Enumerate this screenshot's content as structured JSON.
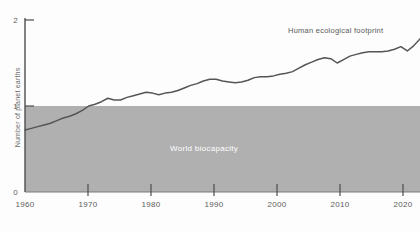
{
  "chart_data": {
    "type": "line",
    "title": "",
    "xlabel": "",
    "ylabel": "Number of planet earths",
    "xlim": [
      1960,
      2022
    ],
    "ylim": [
      0,
      2
    ],
    "grid": false,
    "legend_position": "inline-annotation",
    "x_ticks": [
      "1960",
      "1970",
      "1980",
      "1990",
      "2000",
      "2010",
      "2020"
    ],
    "x_tick_values": [
      1960,
      1970,
      1980,
      1990,
      2000,
      2010,
      2020
    ],
    "y_ticks": [
      "0",
      "1",
      "2"
    ],
    "y_tick_values": [
      0,
      1,
      2
    ],
    "annotations": [
      {
        "text": "Human ecological footprint",
        "x": 2011,
        "y": 1.9
      },
      {
        "text": "World biocapacity",
        "x": 1996,
        "y": 0.55
      }
    ],
    "bands": [
      {
        "label": "World biocapacity",
        "y_from": 0,
        "y_to": 1,
        "color": "#b0b0b0"
      }
    ],
    "series": [
      {
        "name": "Human ecological footprint",
        "color": "#555555",
        "x": [
          1960,
          1961,
          1962,
          1963,
          1964,
          1965,
          1966,
          1967,
          1968,
          1969,
          1970,
          1971,
          1972,
          1973,
          1974,
          1975,
          1976,
          1977,
          1978,
          1979,
          1980,
          1981,
          1982,
          1983,
          1984,
          1985,
          1986,
          1987,
          1988,
          1989,
          1990,
          1991,
          1992,
          1993,
          1994,
          1995,
          1996,
          1997,
          1998,
          1999,
          2000,
          2001,
          2002,
          2003,
          2004,
          2005,
          2006,
          2007,
          2008,
          2009,
          2010,
          2011,
          2012,
          2013,
          2014,
          2015,
          2016,
          2017,
          2018,
          2019,
          2020,
          2021,
          2022
        ],
        "values": [
          0.72,
          0.74,
          0.76,
          0.78,
          0.8,
          0.83,
          0.86,
          0.88,
          0.91,
          0.95,
          1.0,
          1.02,
          1.05,
          1.09,
          1.07,
          1.07,
          1.1,
          1.12,
          1.14,
          1.16,
          1.15,
          1.13,
          1.15,
          1.16,
          1.18,
          1.21,
          1.24,
          1.26,
          1.29,
          1.31,
          1.31,
          1.29,
          1.28,
          1.27,
          1.28,
          1.3,
          1.33,
          1.34,
          1.34,
          1.35,
          1.37,
          1.38,
          1.4,
          1.44,
          1.48,
          1.51,
          1.54,
          1.56,
          1.55,
          1.5,
          1.54,
          1.58,
          1.6,
          1.62,
          1.63,
          1.63,
          1.63,
          1.64,
          1.66,
          1.69,
          1.64,
          1.7,
          1.78
        ]
      }
    ]
  },
  "axis": {
    "y_title": "Number of planet earths"
  }
}
